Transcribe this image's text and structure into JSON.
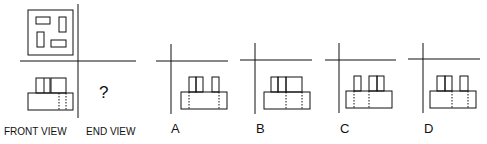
{
  "labels": {
    "front_view": "FRONT VIEW",
    "end_view": "END VIEW",
    "question_mark": "?"
  },
  "options": [
    {
      "letter": "A"
    },
    {
      "letter": "B"
    },
    {
      "letter": "C"
    },
    {
      "letter": "D"
    }
  ],
  "colors": {
    "line": "#111111",
    "background": "#ffffff"
  }
}
